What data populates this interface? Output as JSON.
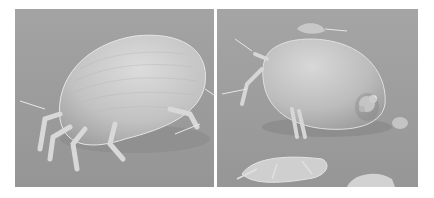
{
  "figure": {
    "panels": [
      {
        "id": "left",
        "subject": "dust mite side view (SEM)",
        "background": "#9a9a9a"
      },
      {
        "id": "right",
        "subject": "dust mite rear view with debris (SEM)",
        "background": "#9c9c9c"
      }
    ],
    "colors": {
      "page_background": "#ffffff",
      "body_light": "#d4d4d4",
      "body_mid": "#b0b0b0",
      "shadow": "#6e6e6e"
    }
  }
}
